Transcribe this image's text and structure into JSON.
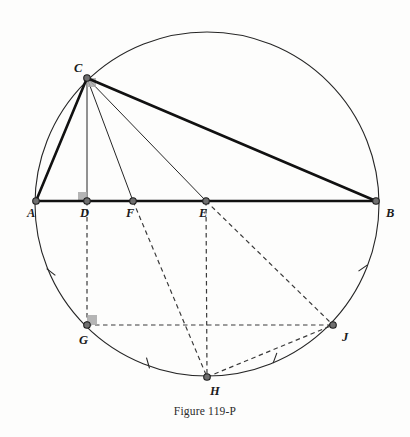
{
  "figure": {
    "caption": "Figure 119-P",
    "background_color": "#fdfdfc",
    "stroke_color": "#262626",
    "dash_color": "#3a3a3a",
    "marker_fill": "#6f6f6f",
    "right_angle_fill": "#a8a8a8"
  },
  "circle": {
    "name": "circumscribed-circle",
    "cx": 207,
    "cy": 204,
    "r": 172,
    "stroke_width": 1.1
  },
  "points": [
    {
      "id": "A",
      "label": "A",
      "x": 36,
      "y": 201,
      "label_x": 27,
      "label_y": 217,
      "on_circle": true,
      "marker": true
    },
    {
      "id": "C",
      "label": "C",
      "x": 87,
      "y": 78,
      "label_x": 74,
      "label_y": 72,
      "on_circle": true,
      "marker": true
    },
    {
      "id": "D",
      "label": "D",
      "x": 87,
      "y": 201,
      "label_x": 80,
      "label_y": 217,
      "on_circle": false,
      "marker": true
    },
    {
      "id": "F",
      "label": "F",
      "x": 133,
      "y": 201,
      "label_x": 126,
      "label_y": 217,
      "on_circle": false,
      "marker": true
    },
    {
      "id": "E",
      "label": "E",
      "x": 206,
      "y": 201,
      "label_x": 199,
      "label_y": 217,
      "on_circle": false,
      "marker": true
    },
    {
      "id": "B",
      "label": "B",
      "x": 376,
      "y": 201,
      "label_x": 386,
      "label_y": 217,
      "on_circle": true,
      "marker": true
    },
    {
      "id": "G",
      "label": "G",
      "x": 87,
      "y": 325,
      "label_x": 79,
      "label_y": 344,
      "on_circle": true,
      "marker": true
    },
    {
      "id": "H",
      "label": "H",
      "x": 207,
      "y": 377,
      "label_x": 210,
      "label_y": 395,
      "on_circle": true,
      "marker": true
    },
    {
      "id": "J",
      "label": "J",
      "x": 333,
      "y": 325,
      "label_x": 342,
      "label_y": 341,
      "on_circle": true,
      "marker": true
    }
  ],
  "segments_bold": [
    {
      "name": "segment-AC",
      "from": "A",
      "to": "C",
      "width": 2.6
    },
    {
      "name": "segment-CB",
      "from": "C",
      "to": "B",
      "width": 2.6
    },
    {
      "name": "segment-AB",
      "from": "A",
      "to": "B",
      "width": 2.6
    }
  ],
  "segments_thin": [
    {
      "name": "segment-CD-altitude",
      "from": "C",
      "to": "D",
      "width": 1.0
    },
    {
      "name": "segment-CF",
      "from": "C",
      "to": "F",
      "width": 1.0
    },
    {
      "name": "segment-CE",
      "from": "C",
      "to": "E",
      "width": 1.0
    }
  ],
  "segments_dashed": [
    {
      "name": "segment-DG",
      "from": "D",
      "to": "G"
    },
    {
      "name": "segment-FH",
      "from": "F",
      "to": "H"
    },
    {
      "name": "segment-EH",
      "from": "E",
      "to": "H"
    },
    {
      "name": "segment-EJ",
      "from": "E",
      "to": "J"
    },
    {
      "name": "segment-GJ",
      "from": "G",
      "to": "J"
    },
    {
      "name": "segment-HJ",
      "from": "H",
      "to": "J"
    }
  ],
  "right_angles": [
    {
      "name": "right-angle-marker-C",
      "x": 87,
      "y": 78,
      "dx": 1,
      "dy": 1,
      "size": 9
    },
    {
      "name": "right-angle-marker-D",
      "x": 87,
      "y": 201,
      "dx": -1,
      "dy": -1,
      "size": 9
    },
    {
      "name": "right-angle-marker-G",
      "x": 87,
      "y": 325,
      "dx": 1,
      "dy": -1,
      "size": 10
    }
  ],
  "arc_ticks": [
    {
      "name": "arc-tick-AG",
      "x": 51,
      "y": 272,
      "angle": 38
    },
    {
      "name": "arc-tick-GH",
      "x": 148,
      "y": 363,
      "angle": 74
    },
    {
      "name": "arc-tick-HJ",
      "x": 275,
      "y": 358,
      "angle": 110
    },
    {
      "name": "arc-tick-JB",
      "x": 363,
      "y": 268,
      "angle": 145
    }
  ]
}
